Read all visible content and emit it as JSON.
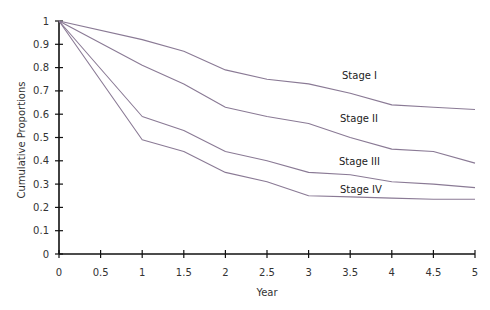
{
  "chart_data": {
    "type": "line",
    "title": "",
    "xlabel": "Year",
    "ylabel": "Cumulative Proportions",
    "xlim": [
      0,
      5
    ],
    "ylim": [
      0,
      1
    ],
    "grid": false,
    "legend": "inline labels near line ends",
    "x_ticks": [
      "0",
      "0.5",
      "1",
      "1.5",
      "2",
      "2.5",
      "3",
      "3.5",
      "4",
      "4.5",
      "5"
    ],
    "y_ticks": [
      "0",
      "0.1",
      "0.2",
      "0.3",
      "0.4",
      "0.5",
      "0.6",
      "0.7",
      "0.8",
      "0.9",
      "1"
    ],
    "x": [
      0,
      1,
      1.5,
      2,
      2.5,
      3,
      3.5,
      4,
      4.5,
      5
    ],
    "series": [
      {
        "name": "Stage I",
        "values": [
          1.0,
          0.92,
          0.87,
          0.79,
          0.75,
          0.73,
          0.69,
          0.64,
          0.63,
          0.62
        ]
      },
      {
        "name": "Stage II",
        "values": [
          1.0,
          0.81,
          0.73,
          0.63,
          0.59,
          0.56,
          0.5,
          0.45,
          0.44,
          0.39
        ]
      },
      {
        "name": "Stage III",
        "values": [
          1.0,
          0.59,
          0.53,
          0.44,
          0.4,
          0.35,
          0.34,
          0.31,
          0.3,
          0.285
        ]
      },
      {
        "name": "Stage IV",
        "values": [
          1.0,
          0.49,
          0.44,
          0.35,
          0.31,
          0.25,
          0.245,
          0.24,
          0.235,
          0.235
        ]
      }
    ],
    "line_color": "#8a7a95",
    "axis_color": "#111111"
  },
  "labels": {
    "stage1": "Stage I",
    "stage2": "Stage II",
    "stage3": "Stage III",
    "stage4": "Stage IV",
    "xlabel": "Year",
    "ylabel": "Cumulative Proportions"
  }
}
